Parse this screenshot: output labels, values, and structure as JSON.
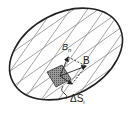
{
  "diagram": {
    "labels": {
      "field": "B",
      "normal_component": "B",
      "normal_subscript": "n",
      "area_element": "ΔS",
      "area_subscript": "i"
    },
    "colors": {
      "outline": "#222222",
      "grid": "#888888",
      "patch_fill": "#777777",
      "background": "#ffffff"
    }
  }
}
